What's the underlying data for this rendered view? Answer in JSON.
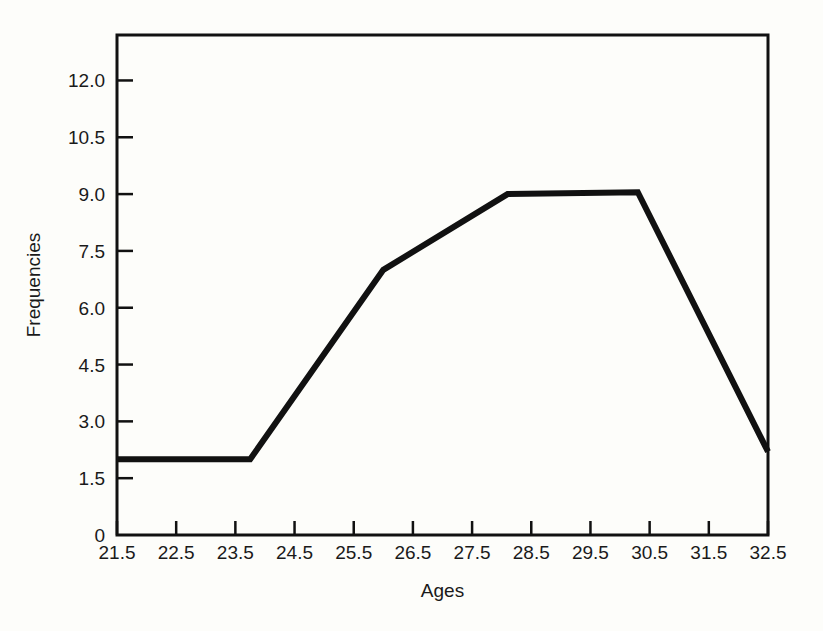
{
  "chart_data": {
    "type": "line",
    "title": "",
    "xlabel": "Ages",
    "ylabel": "Frequencies",
    "xlim": [
      21.5,
      32.5
    ],
    "ylim": [
      0,
      13.2
    ],
    "grid": false,
    "legend": "none",
    "xticks": [
      "21.5",
      "22.5",
      "23.5",
      "24.5",
      "25.5",
      "26.5",
      "27.5",
      "28.5",
      "29.5",
      "30.5",
      "31.5",
      "32.5"
    ],
    "xtick_values": [
      21.5,
      22.5,
      23.5,
      24.5,
      25.5,
      26.5,
      27.5,
      28.5,
      29.5,
      30.5,
      31.5,
      32.5
    ],
    "yticks": [
      "0",
      "1.5",
      "3.0",
      "4.5",
      "6.0",
      "7.5",
      "9.0",
      "10.5",
      "12.0"
    ],
    "ytick_values": [
      0,
      1.5,
      3.0,
      4.5,
      6.0,
      7.5,
      9.0,
      10.5,
      12.0
    ],
    "series": [
      {
        "name": "Frequencies",
        "color": "#111111",
        "x": [
          21.5,
          23.75,
          26.0,
          28.1,
          30.3,
          32.5
        ],
        "values": [
          2.0,
          2.0,
          7.0,
          9.0,
          9.05,
          2.2
        ]
      }
    ]
  },
  "axes": {
    "x_label": "Ages",
    "y_label": "Frequencies"
  }
}
